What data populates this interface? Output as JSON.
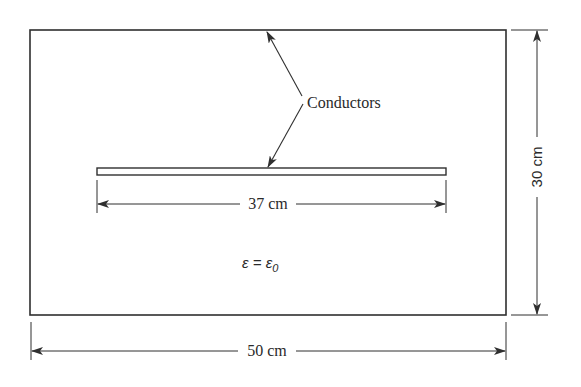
{
  "diagram": {
    "outer_conductor": {
      "label": "Conductors"
    },
    "inner_plate": {},
    "labels": {
      "conductors": "Conductors",
      "plate_width": "37 cm",
      "box_width": "50 cm",
      "box_height": "30 cm",
      "permittivity": "ε = ε",
      "permittivity_subscript": "0"
    },
    "colors": {
      "stroke": "#2f2f2f",
      "text": "#2a2a2a",
      "background": "#ffffff"
    }
  }
}
